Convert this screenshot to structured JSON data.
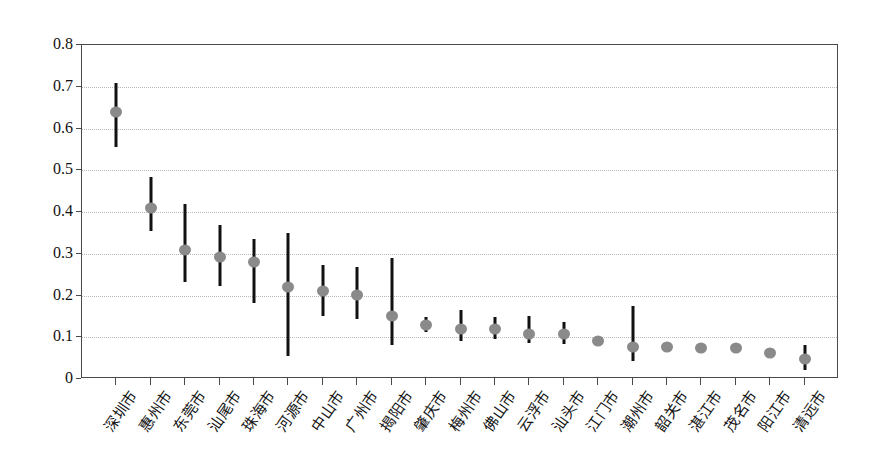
{
  "chart_data": {
    "type": "scatter",
    "title": "",
    "xlabel": "",
    "ylabel": "",
    "ylim": [
      0,
      0.8
    ],
    "ytick_labels": [
      "0",
      "0.1",
      "0.2",
      "0.3",
      "0.4",
      "0.5",
      "0.6",
      "0.7",
      "0.8"
    ],
    "ytick_values": [
      0,
      0.1,
      0.2,
      0.3,
      0.4,
      0.5,
      0.6,
      0.7,
      0.8
    ],
    "grid": true,
    "legend": "none",
    "error_bars": true,
    "marker_color": "#8a8a8a",
    "errorbar_color": "#111111",
    "categories": [
      "深圳市",
      "惠州市",
      "东莞市",
      "汕尾市",
      "珠海市",
      "河源市",
      "中山市",
      "广州市",
      "揭阳市",
      "肇庆市",
      "梅州市",
      "佛山市",
      "云浮市",
      "汕头市",
      "江门市",
      "潮州市",
      "韶关市",
      "湛江市",
      "茂名市",
      "阳江市",
      "清远市"
    ],
    "values": [
      0.64,
      0.41,
      0.31,
      0.292,
      0.28,
      0.22,
      0.21,
      0.202,
      0.15,
      0.13,
      0.12,
      0.12,
      0.108,
      0.108,
      0.09,
      0.077,
      0.077,
      0.075,
      0.075,
      0.063,
      0.048
    ],
    "lower": [
      0.555,
      0.355,
      0.232,
      0.222,
      0.182,
      0.055,
      0.152,
      0.143,
      0.082,
      0.113,
      0.09,
      0.095,
      0.086,
      0.085,
      0.083,
      0.043,
      0.077,
      0.075,
      0.075,
      0.056,
      0.022
    ],
    "upper": [
      0.71,
      0.485,
      0.418,
      0.37,
      0.335,
      0.35,
      0.272,
      0.268,
      0.29,
      0.148,
      0.165,
      0.148,
      0.152,
      0.137,
      0.098,
      0.175,
      0.077,
      0.075,
      0.075,
      0.07,
      0.082
    ]
  }
}
